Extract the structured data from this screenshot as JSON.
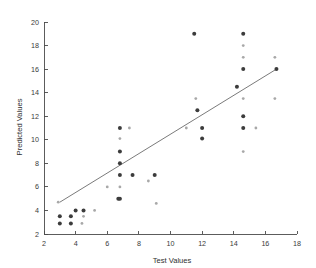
{
  "chart_data": {
    "type": "scatter",
    "title": "",
    "xlabel": "Test Values",
    "ylabel": "Predicted Values",
    "xlim": [
      2,
      18
    ],
    "ylim": [
      2,
      20
    ],
    "xticks": [
      2,
      4,
      6,
      8,
      10,
      12,
      14,
      16,
      18
    ],
    "yticks": [
      2,
      4,
      6,
      8,
      10,
      12,
      14,
      16,
      18,
      20
    ],
    "grid": false,
    "legend": null,
    "series": [
      {
        "name": "observations",
        "marker": "circle",
        "points": [
          {
            "x": 2.9,
            "y": 4.7,
            "shade": "light"
          },
          {
            "x": 3.0,
            "y": 3.5,
            "shade": "dark"
          },
          {
            "x": 3.0,
            "y": 2.9,
            "shade": "dark"
          },
          {
            "x": 3.7,
            "y": 3.5,
            "shade": "dark"
          },
          {
            "x": 3.7,
            "y": 2.9,
            "shade": "dark"
          },
          {
            "x": 4.0,
            "y": 4.0,
            "shade": "dark"
          },
          {
            "x": 4.4,
            "y": 2.9,
            "shade": "light"
          },
          {
            "x": 4.5,
            "y": 4.0,
            "shade": "dark"
          },
          {
            "x": 4.5,
            "y": 3.5,
            "shade": "light"
          },
          {
            "x": 5.2,
            "y": 4.0,
            "shade": "light"
          },
          {
            "x": 6.0,
            "y": 6.0,
            "shade": "light"
          },
          {
            "x": 6.7,
            "y": 5.0,
            "shade": "dark"
          },
          {
            "x": 6.8,
            "y": 11.0,
            "shade": "dark"
          },
          {
            "x": 6.8,
            "y": 10.1,
            "shade": "light"
          },
          {
            "x": 6.8,
            "y": 9.0,
            "shade": "dark"
          },
          {
            "x": 6.8,
            "y": 8.0,
            "shade": "dark"
          },
          {
            "x": 6.8,
            "y": 7.0,
            "shade": "dark"
          },
          {
            "x": 6.8,
            "y": 6.0,
            "shade": "light"
          },
          {
            "x": 6.8,
            "y": 5.0,
            "shade": "dark"
          },
          {
            "x": 7.4,
            "y": 11.0,
            "shade": "light"
          },
          {
            "x": 7.6,
            "y": 7.0,
            "shade": "dark"
          },
          {
            "x": 8.6,
            "y": 6.5,
            "shade": "light"
          },
          {
            "x": 9.0,
            "y": 7.0,
            "shade": "dark"
          },
          {
            "x": 9.1,
            "y": 4.6,
            "shade": "light"
          },
          {
            "x": 11.0,
            "y": 11.0,
            "shade": "light"
          },
          {
            "x": 11.5,
            "y": 19.0,
            "shade": "dark"
          },
          {
            "x": 11.6,
            "y": 13.5,
            "shade": "light"
          },
          {
            "x": 11.7,
            "y": 12.5,
            "shade": "dark"
          },
          {
            "x": 12.0,
            "y": 11.0,
            "shade": "dark"
          },
          {
            "x": 12.0,
            "y": 10.1,
            "shade": "dark"
          },
          {
            "x": 14.6,
            "y": 19.0,
            "shade": "dark"
          },
          {
            "x": 14.6,
            "y": 18.0,
            "shade": "light"
          },
          {
            "x": 14.6,
            "y": 17.0,
            "shade": "light"
          },
          {
            "x": 14.6,
            "y": 16.0,
            "shade": "dark"
          },
          {
            "x": 14.6,
            "y": 13.5,
            "shade": "light"
          },
          {
            "x": 14.6,
            "y": 12.0,
            "shade": "dark"
          },
          {
            "x": 14.6,
            "y": 11.0,
            "shade": "dark"
          },
          {
            "x": 14.6,
            "y": 9.0,
            "shade": "light"
          },
          {
            "x": 14.2,
            "y": 14.5,
            "shade": "dark"
          },
          {
            "x": 15.4,
            "y": 11.0,
            "shade": "light"
          },
          {
            "x": 16.6,
            "y": 17.0,
            "shade": "light"
          },
          {
            "x": 16.7,
            "y": 16.0,
            "shade": "dark"
          },
          {
            "x": 16.6,
            "y": 13.5,
            "shade": "light"
          }
        ]
      }
    ],
    "fit_line": {
      "name": "regression-line",
      "x": [
        3.0,
        16.7
      ],
      "y": [
        4.7,
        16.0
      ]
    }
  }
}
